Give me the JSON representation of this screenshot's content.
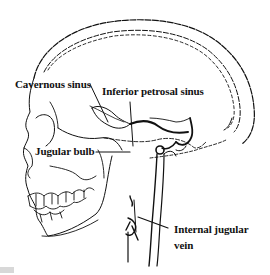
{
  "diagram": {
    "colors": {
      "line": "#111111",
      "background": "#ffffff"
    },
    "labels": [
      {
        "id": "cavernous-sinus",
        "text": "Cavernous sinus"
      },
      {
        "id": "inferior-petrosal-sinus",
        "text": "Inferior petrosal sinus"
      },
      {
        "id": "jugular-bulb",
        "text": "Jugular bulb"
      },
      {
        "id": "internal-jugular-vein-line1",
        "text": "Internal jugular"
      },
      {
        "id": "internal-jugular-vein-line2",
        "text": "vein"
      }
    ]
  }
}
